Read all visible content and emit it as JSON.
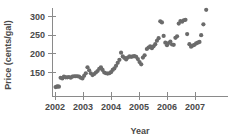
{
  "chart_data": {
    "type": "scatter",
    "title": "",
    "xlabel": "Year",
    "ylabel": "Price (cents/gal)",
    "xlim": [
      2002.0,
      2007.6
    ],
    "ylim": [
      100,
      330
    ],
    "grid": false,
    "legend": "none",
    "xticks": [
      2002,
      2003,
      2004,
      2005,
      2006,
      2007
    ],
    "xticklabels": [
      "2002",
      "2003",
      "2004",
      "2005",
      "2006",
      "2007"
    ],
    "yticks": [
      150,
      200,
      250,
      300
    ],
    "yticklabels": [
      "150",
      "200",
      "250",
      "300"
    ],
    "marker": "circle",
    "marker_color": "#6b6b6b",
    "marker_size": 2.1,
    "points": [
      {
        "x": 2002.02,
        "y": 111
      },
      {
        "x": 2002.06,
        "y": 112
      },
      {
        "x": 2002.1,
        "y": 113
      },
      {
        "x": 2002.14,
        "y": 112
      },
      {
        "x": 2002.2,
        "y": 136
      },
      {
        "x": 2002.26,
        "y": 134
      },
      {
        "x": 2002.32,
        "y": 139
      },
      {
        "x": 2002.38,
        "y": 137
      },
      {
        "x": 2002.44,
        "y": 137
      },
      {
        "x": 2002.5,
        "y": 138
      },
      {
        "x": 2002.56,
        "y": 136
      },
      {
        "x": 2002.62,
        "y": 139
      },
      {
        "x": 2002.68,
        "y": 140
      },
      {
        "x": 2002.74,
        "y": 140
      },
      {
        "x": 2002.8,
        "y": 140
      },
      {
        "x": 2002.86,
        "y": 139
      },
      {
        "x": 2002.92,
        "y": 136
      },
      {
        "x": 2002.98,
        "y": 134
      },
      {
        "x": 2003.04,
        "y": 141
      },
      {
        "x": 2003.1,
        "y": 148
      },
      {
        "x": 2003.16,
        "y": 164
      },
      {
        "x": 2003.22,
        "y": 156
      },
      {
        "x": 2003.28,
        "y": 148
      },
      {
        "x": 2003.34,
        "y": 143
      },
      {
        "x": 2003.4,
        "y": 146
      },
      {
        "x": 2003.46,
        "y": 150
      },
      {
        "x": 2003.52,
        "y": 154
      },
      {
        "x": 2003.58,
        "y": 160
      },
      {
        "x": 2003.64,
        "y": 164
      },
      {
        "x": 2003.7,
        "y": 157
      },
      {
        "x": 2003.76,
        "y": 150
      },
      {
        "x": 2003.82,
        "y": 148
      },
      {
        "x": 2003.88,
        "y": 147
      },
      {
        "x": 2003.94,
        "y": 148
      },
      {
        "x": 2004.0,
        "y": 151
      },
      {
        "x": 2004.06,
        "y": 157
      },
      {
        "x": 2004.12,
        "y": 161
      },
      {
        "x": 2004.18,
        "y": 168
      },
      {
        "x": 2004.24,
        "y": 176
      },
      {
        "x": 2004.3,
        "y": 184
      },
      {
        "x": 2004.36,
        "y": 203
      },
      {
        "x": 2004.42,
        "y": 193
      },
      {
        "x": 2004.48,
        "y": 189
      },
      {
        "x": 2004.54,
        "y": 185
      },
      {
        "x": 2004.6,
        "y": 190
      },
      {
        "x": 2004.66,
        "y": 193
      },
      {
        "x": 2004.72,
        "y": 192
      },
      {
        "x": 2004.78,
        "y": 193
      },
      {
        "x": 2004.84,
        "y": 194
      },
      {
        "x": 2004.9,
        "y": 192
      },
      {
        "x": 2004.96,
        "y": 186
      },
      {
        "x": 2005.02,
        "y": 178
      },
      {
        "x": 2005.08,
        "y": 172
      },
      {
        "x": 2005.14,
        "y": 190
      },
      {
        "x": 2005.2,
        "y": 196
      },
      {
        "x": 2005.28,
        "y": 213
      },
      {
        "x": 2005.34,
        "y": 217
      },
      {
        "x": 2005.4,
        "y": 220
      },
      {
        "x": 2005.46,
        "y": 215
      },
      {
        "x": 2005.52,
        "y": 220
      },
      {
        "x": 2005.58,
        "y": 226
      },
      {
        "x": 2005.64,
        "y": 235
      },
      {
        "x": 2005.7,
        "y": 242
      },
      {
        "x": 2005.76,
        "y": 287
      },
      {
        "x": 2005.82,
        "y": 284
      },
      {
        "x": 2005.88,
        "y": 248
      },
      {
        "x": 2005.94,
        "y": 230
      },
      {
        "x": 2006.0,
        "y": 223
      },
      {
        "x": 2006.06,
        "y": 229
      },
      {
        "x": 2006.12,
        "y": 233
      },
      {
        "x": 2006.18,
        "y": 225
      },
      {
        "x": 2006.24,
        "y": 224
      },
      {
        "x": 2006.3,
        "y": 243
      },
      {
        "x": 2006.36,
        "y": 247
      },
      {
        "x": 2006.42,
        "y": 281
      },
      {
        "x": 2006.48,
        "y": 288
      },
      {
        "x": 2006.54,
        "y": 286
      },
      {
        "x": 2006.6,
        "y": 290
      },
      {
        "x": 2006.66,
        "y": 291
      },
      {
        "x": 2006.72,
        "y": 253
      },
      {
        "x": 2006.8,
        "y": 226
      },
      {
        "x": 2006.86,
        "y": 219
      },
      {
        "x": 2006.92,
        "y": 222
      },
      {
        "x": 2006.98,
        "y": 224
      },
      {
        "x": 2007.04,
        "y": 228
      },
      {
        "x": 2007.1,
        "y": 230
      },
      {
        "x": 2007.16,
        "y": 232
      },
      {
        "x": 2007.22,
        "y": 250
      },
      {
        "x": 2007.3,
        "y": 279
      },
      {
        "x": 2007.4,
        "y": 318
      }
    ]
  }
}
